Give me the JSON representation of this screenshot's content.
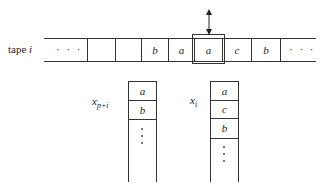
{
  "tape": {
    "label_prefix": "tape",
    "label_var": "i",
    "cells": [
      "· · ·",
      "",
      "",
      "b",
      "a",
      "a",
      "c",
      "b",
      "· · ·"
    ],
    "head_index": 5
  },
  "stacks": [
    {
      "label_var": "x",
      "label_sub": "p+i",
      "cells": [
        "a",
        "b"
      ],
      "continues": true
    },
    {
      "label_var": "x",
      "label_sub": "i",
      "cells": [
        "a",
        "c",
        "b"
      ],
      "continues": true
    }
  ],
  "colors": {
    "line": "#333333",
    "background": "#ffffff"
  }
}
